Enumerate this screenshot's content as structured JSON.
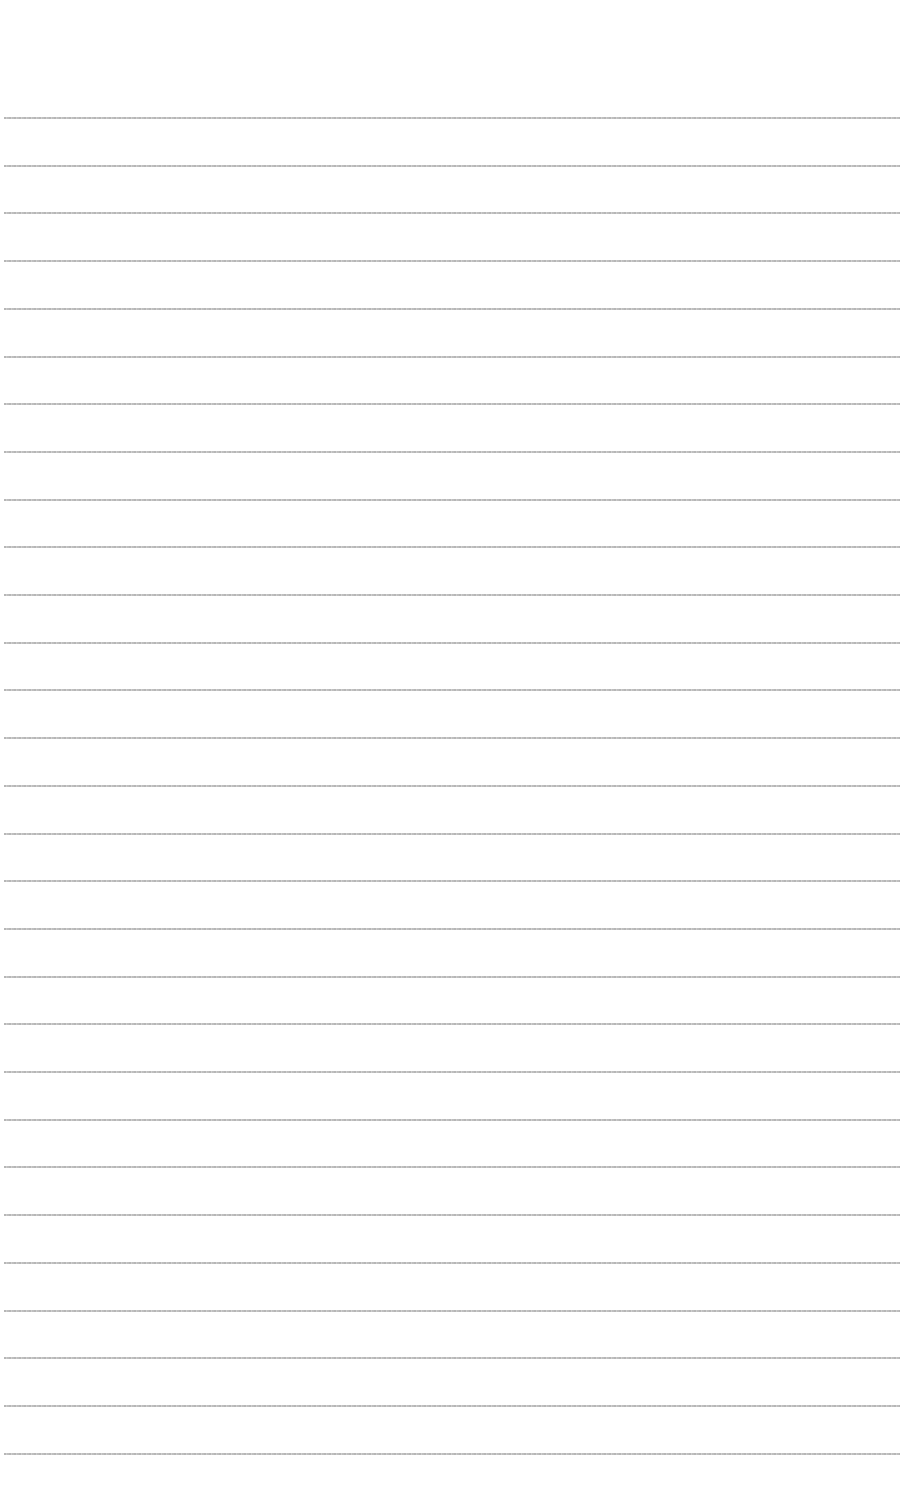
{
  "page": {
    "type": "lined-paper",
    "background": "#ffffff",
    "line_color": "#b0b0b0",
    "line_count": 29,
    "first_line_y": 117,
    "line_spacing": 47.7
  },
  "header_bleed": {
    "fragments": [
      "",
      "",
      ""
    ]
  }
}
